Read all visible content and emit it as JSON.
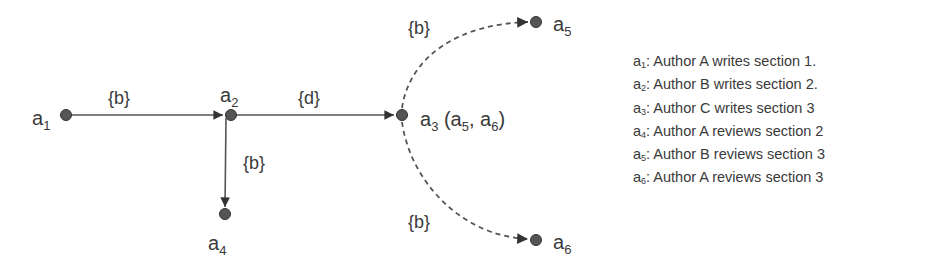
{
  "nodes": [
    {
      "id": "a1",
      "label": "a",
      "sub": "1",
      "suffix": ""
    },
    {
      "id": "a2",
      "label": "a",
      "sub": "2",
      "suffix": ""
    },
    {
      "id": "a3",
      "label": "a",
      "sub": "3",
      "suffix": " (a5, a6)"
    },
    {
      "id": "a4",
      "label": "a",
      "sub": "4",
      "suffix": ""
    },
    {
      "id": "a5",
      "label": "a",
      "sub": "5",
      "suffix": ""
    },
    {
      "id": "a6",
      "label": "a",
      "sub": "6",
      "suffix": ""
    }
  ],
  "a3_label": {
    "main": "a",
    "sub": "3",
    "open": " (a",
    "s1": "5",
    "mid": ", a",
    "s2": "6",
    "close": ")"
  },
  "edges": [
    {
      "from": "a1",
      "to": "a2",
      "label": "{b}",
      "style": "solid"
    },
    {
      "from": "a2",
      "to": "a3",
      "label": "{d}",
      "style": "solid"
    },
    {
      "from": "a2",
      "to": "a4",
      "label": "{b}",
      "style": "solid"
    },
    {
      "from": "a3",
      "to": "a5",
      "label": "{b}",
      "style": "dashed"
    },
    {
      "from": "a3",
      "to": "a6",
      "label": "{b}",
      "style": "dashed"
    }
  ],
  "legend": [
    {
      "var": "a",
      "sub": "1",
      "text": ": Author A writes section 1."
    },
    {
      "var": "a",
      "sub": "2",
      "text": ": Author B writes section 2."
    },
    {
      "var": "a",
      "sub": "3",
      "text": ": Author C writes section 3"
    },
    {
      "var": "a",
      "sub": "4",
      "text": ": Author A reviews  section 2"
    },
    {
      "var": "a",
      "sub": "5",
      "text": ": Author B reviews  section 3"
    },
    {
      "var": "a",
      "sub": "6",
      "text": ": Author A reviews  section 3"
    }
  ],
  "colors": {
    "node": "#555555",
    "edge": "#555555",
    "text": "#3a3a3a"
  }
}
